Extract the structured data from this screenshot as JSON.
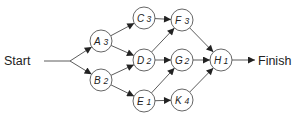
{
  "diagram": {
    "type": "activity-on-node network",
    "start_label": "Start",
    "finish_label": "Finish",
    "nodes": [
      {
        "id": "A",
        "duration": "3",
        "x": 101,
        "y": 41
      },
      {
        "id": "B",
        "duration": "2",
        "x": 101,
        "y": 80
      },
      {
        "id": "C",
        "duration": "3",
        "x": 144,
        "y": 18
      },
      {
        "id": "D",
        "duration": "2",
        "x": 144,
        "y": 60
      },
      {
        "id": "E",
        "duration": "1",
        "x": 144,
        "y": 101
      },
      {
        "id": "F",
        "duration": "3",
        "x": 182,
        "y": 20
      },
      {
        "id": "G",
        "duration": "2",
        "x": 182,
        "y": 60
      },
      {
        "id": "K",
        "duration": "4",
        "x": 182,
        "y": 100
      },
      {
        "id": "H",
        "duration": "1",
        "x": 221,
        "y": 60
      }
    ],
    "edges": [
      [
        "Start",
        "A"
      ],
      [
        "Start",
        "B"
      ],
      [
        "A",
        "C"
      ],
      [
        "A",
        "D"
      ],
      [
        "B",
        "D"
      ],
      [
        "B",
        "E"
      ],
      [
        "C",
        "F"
      ],
      [
        "D",
        "F"
      ],
      [
        "D",
        "G"
      ],
      [
        "E",
        "G"
      ],
      [
        "E",
        "K"
      ],
      [
        "F",
        "H"
      ],
      [
        "G",
        "H"
      ],
      [
        "K",
        "H"
      ],
      [
        "H",
        "Finish"
      ]
    ],
    "colors": {
      "stroke": "#4a4a4a",
      "node_fill": "#ffffff",
      "text": "#222222"
    }
  }
}
